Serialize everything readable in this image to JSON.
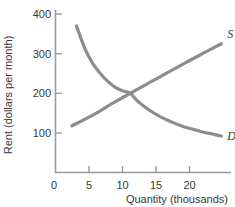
{
  "chart_data": {
    "type": "line",
    "title": "",
    "xlabel": "Quantity (thousands)",
    "ylabel": "Rent (dollars per month)",
    "xlim": [
      0,
      23.5
    ],
    "ylim": [
      0,
      430
    ],
    "xticks": [
      "0",
      "5",
      "10",
      "15",
      "20"
    ],
    "xtick_values": [
      0,
      5,
      10,
      15,
      20
    ],
    "yticks": [
      "0",
      "100",
      "200",
      "300",
      "400"
    ],
    "ytick_values": [
      0,
      100,
      200,
      300,
      400
    ],
    "grid": false,
    "legend_position": "inline-end-of-curve",
    "equilibrium": {
      "quantity": 10,
      "rent": 200
    },
    "series": [
      {
        "name": "D",
        "label": "D",
        "role": "demand",
        "color": "#8d8d8d",
        "x": [
          2.8,
          4,
          5,
          6,
          7,
          8,
          9,
          10,
          11,
          12,
          13,
          14,
          15,
          16,
          17,
          18,
          19,
          20,
          21,
          22.2
        ],
        "values": [
          370,
          310,
          275,
          250,
          230,
          215,
          206,
          200,
          180,
          165,
          152,
          141,
          132,
          124,
          117,
          111,
          106,
          101,
          97,
          92
        ]
      },
      {
        "name": "S",
        "label": "S",
        "role": "supply",
        "color": "#8d8d8d",
        "x": [
          2.2,
          5,
          7.5,
          10,
          12.5,
          15,
          17.5,
          20,
          22.2
        ],
        "values": [
          118,
          145,
          173,
          200,
          226,
          252,
          278,
          303,
          325
        ]
      }
    ]
  },
  "axis": {
    "x_tick_labels": [
      "0",
      "5",
      "10",
      "15",
      "20"
    ],
    "y_tick_labels": [
      "0",
      "100",
      "200",
      "300",
      "400"
    ],
    "x_axis_title": "Quantity (thousands)",
    "y_axis_title": "Rent (dollars per month)",
    "axis_color": "#9a9a9a"
  },
  "labels": {
    "supply_curve": "S",
    "demand_curve": "D"
  }
}
